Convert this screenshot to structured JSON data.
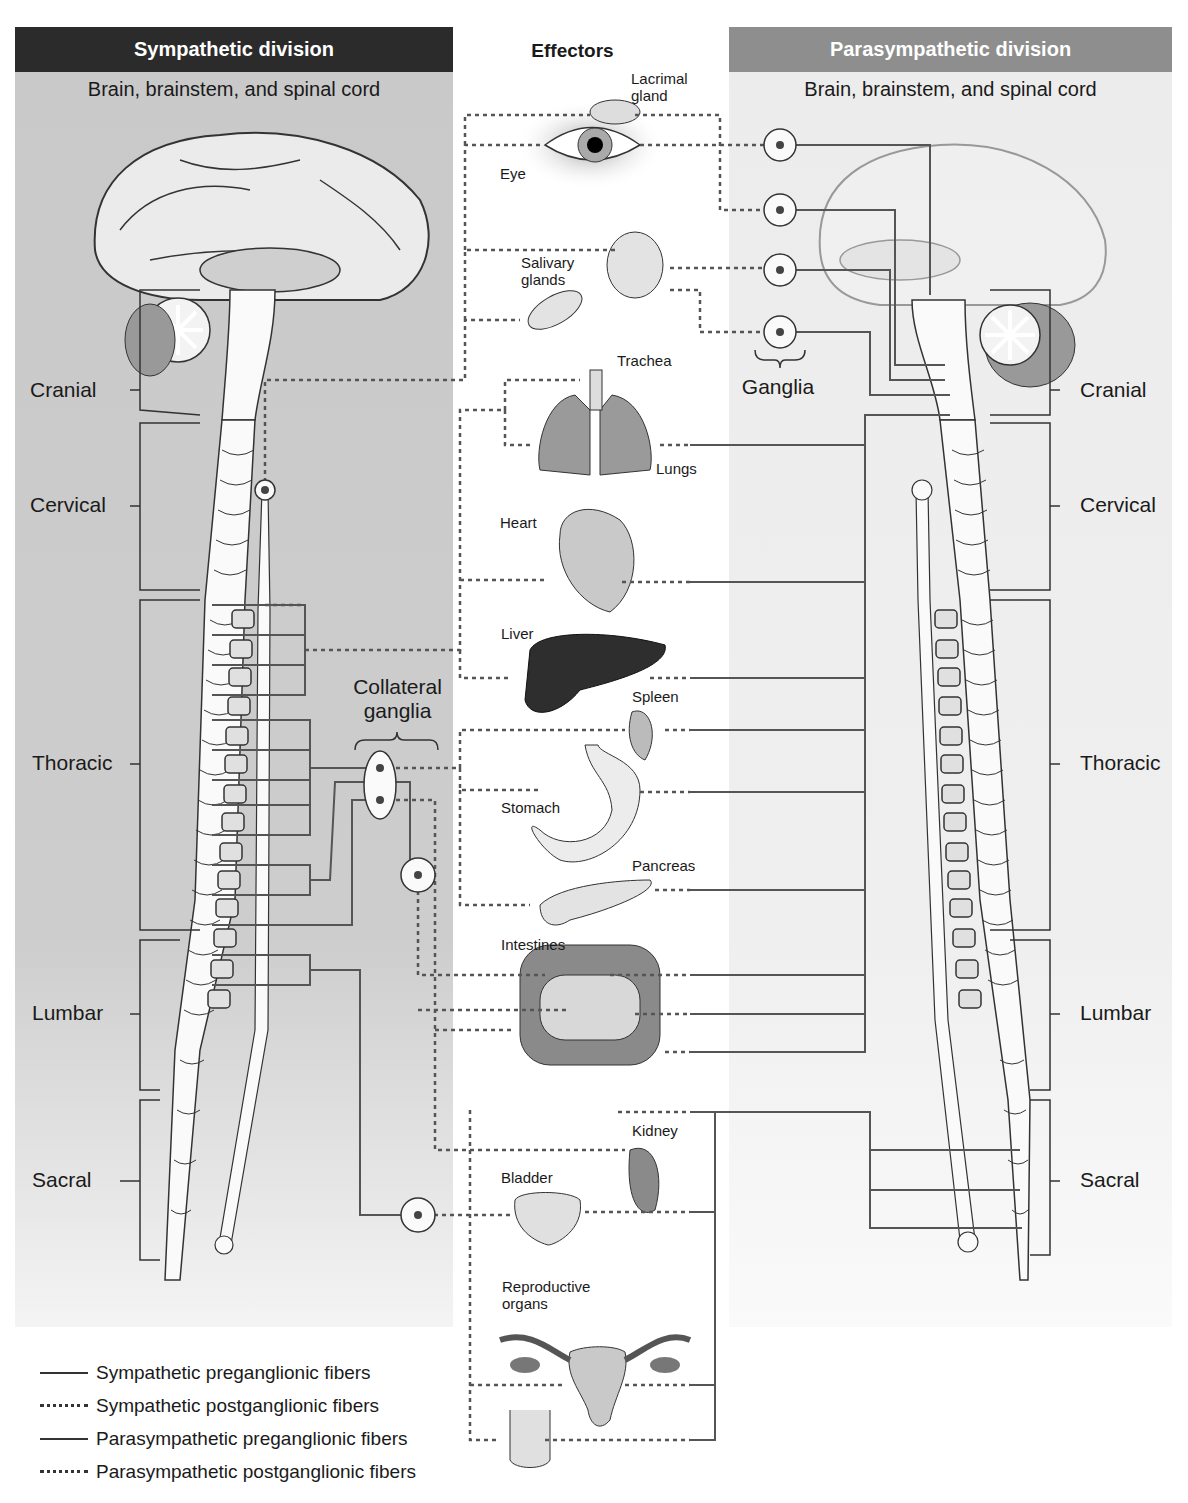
{
  "headers": {
    "sympathetic": "Sympathetic division",
    "effectors": "Effectors",
    "parasympathetic": "Parasympathetic division"
  },
  "subtitles": {
    "sympathetic": "Brain, brainstem, and spinal cord",
    "parasympathetic": "Brain, brainstem, and spinal cord"
  },
  "spinal_segments": {
    "left": [
      "Cranial",
      "Cervical",
      "Thoracic",
      "Lumbar",
      "Sacral"
    ],
    "right": [
      "Cranial",
      "Cervical",
      "Thoracic",
      "Lumbar",
      "Sacral"
    ]
  },
  "ganglia_labels": {
    "collateral_line1": "Collateral",
    "collateral_line2": "ganglia",
    "parasympathetic": "Ganglia"
  },
  "organs": [
    {
      "label": "Lacrimal gland",
      "line1": "Lacrimal",
      "line2": "gland"
    },
    {
      "label": "Eye"
    },
    {
      "label": "Salivary glands",
      "line1": "Salivary",
      "line2": "glands"
    },
    {
      "label": "Trachea"
    },
    {
      "label": "Lungs"
    },
    {
      "label": "Heart"
    },
    {
      "label": "Liver"
    },
    {
      "label": "Spleen"
    },
    {
      "label": "Stomach"
    },
    {
      "label": "Pancreas"
    },
    {
      "label": "Intestines"
    },
    {
      "label": "Kidney"
    },
    {
      "label": "Bladder"
    },
    {
      "label": "Reproductive organs",
      "line1": "Reproductive",
      "line2": "organs"
    }
  ],
  "legend": [
    {
      "style": "solid",
      "label": "Sympathetic preganglionic fibers"
    },
    {
      "style": "dotted",
      "label": "Sympathetic postganglionic fibers"
    },
    {
      "style": "solid",
      "label": "Parasympathetic preganglionic fibers"
    },
    {
      "style": "dotted",
      "label": "Parasympathetic postganglionic fibers"
    }
  ],
  "colors": {
    "sym_header_bg": "#2b2b2b",
    "para_header_bg": "#8e8e8e",
    "sym_panel_bg": "#c9c9c9",
    "para_panel_bg": "#ececec",
    "fiber": "#555555"
  }
}
